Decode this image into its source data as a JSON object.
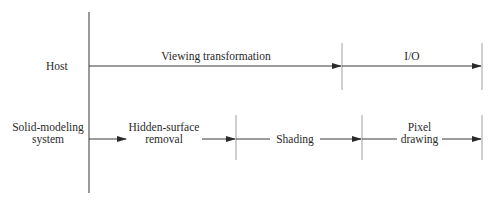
{
  "diagram": {
    "type": "timing-flow",
    "rows": [
      {
        "label": "Host",
        "stages": [
          {
            "label": "Viewing transformation"
          },
          {
            "label": "I/O"
          }
        ]
      },
      {
        "label_line1": "Solid-modeling",
        "label_line2": "system",
        "stages": [
          {
            "label_line1": "Hidden-surface",
            "label_line2": "removal"
          },
          {
            "label": "Shading"
          },
          {
            "label_line1": "Pixel",
            "label_line2": "drawing"
          }
        ]
      }
    ],
    "colors": {
      "line": "#3a3a3a",
      "tick": "#9a9a9a",
      "text": "#2a2a2a"
    }
  }
}
